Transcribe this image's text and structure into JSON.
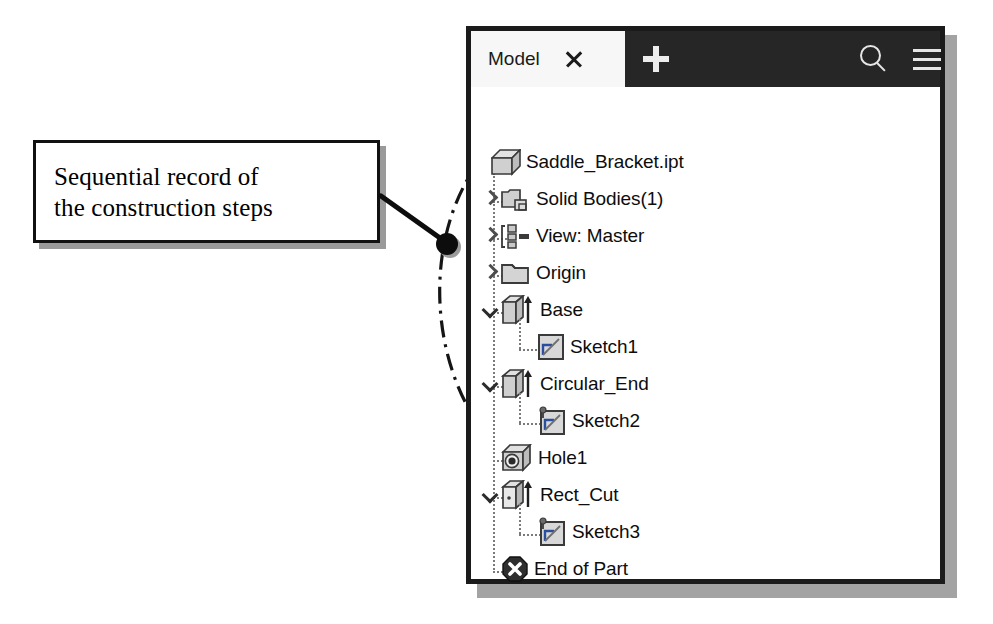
{
  "annotation": {
    "callout_text": "Sequential record of\nthe construction steps",
    "highlight_shape": "dash-dot-ellipse",
    "leader_endpoint_marker": "filled-dot"
  },
  "panel": {
    "header": {
      "tab_label": "Model",
      "close_icon": "close-icon",
      "add_icon": "plus-icon",
      "search_icon": "search-icon",
      "menu_icon": "hamburger-menu-icon",
      "bar_color": "#262626",
      "tab_bg_color": "#f7f7f7"
    },
    "tree": {
      "items": [
        {
          "label": "Saddle_Bracket.ipt",
          "icon": "part-cube-icon",
          "depth": 0,
          "expander": "none",
          "connector": "none"
        },
        {
          "label": "Solid Bodies(1)",
          "icon": "solid-bodies-icon",
          "depth": 1,
          "expander": "collapsed",
          "connector": "tee"
        },
        {
          "label": "View: Master",
          "icon": "view-master-icon",
          "depth": 1,
          "expander": "collapsed",
          "connector": "tee"
        },
        {
          "label": "Origin",
          "icon": "folder-icon",
          "depth": 1,
          "expander": "collapsed",
          "connector": "tee"
        },
        {
          "label": "Base",
          "icon": "extrude-icon",
          "depth": 1,
          "expander": "expanded",
          "connector": "tee"
        },
        {
          "label": "Sketch1",
          "icon": "sketch-icon",
          "depth": 2,
          "expander": "none",
          "connector": "elbow"
        },
        {
          "label": "Circular_End",
          "icon": "extrude-icon",
          "depth": 1,
          "expander": "expanded",
          "connector": "tee"
        },
        {
          "label": "Sketch2",
          "icon": "sketch-pin-icon",
          "depth": 2,
          "expander": "none",
          "connector": "elbow"
        },
        {
          "label": "Hole1",
          "icon": "hole-icon",
          "depth": 1,
          "expander": "none",
          "connector": "tee"
        },
        {
          "label": "Rect_Cut",
          "icon": "extrude-cut-icon",
          "depth": 1,
          "expander": "expanded",
          "connector": "tee"
        },
        {
          "label": "Sketch3",
          "icon": "sketch-pin-icon",
          "depth": 2,
          "expander": "none",
          "connector": "elbow"
        },
        {
          "label": "End of Part",
          "icon": "end-of-part-icon",
          "depth": 1,
          "expander": "none",
          "connector": "elbow"
        }
      ]
    }
  },
  "colors": {
    "panel_border": "#1b1b1b",
    "panel_shadow": "#a3a3a3",
    "icon_fill": "#c8c8c8",
    "icon_stroke": "#3a3a3a",
    "text": "#0d0d0d"
  }
}
